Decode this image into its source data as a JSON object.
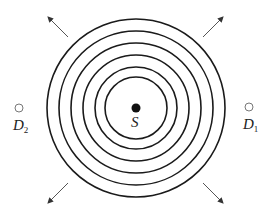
{
  "figure": {
    "colors": {
      "background": "#ffffff",
      "ink": "#1a1a1a",
      "detector": "#777777",
      "arrow": "#555555"
    },
    "source": {
      "label": "S",
      "cx": 136,
      "cy": 108,
      "r": 4.5
    },
    "wavefronts": {
      "cx": 136,
      "cy": 108,
      "radii": [
        31,
        41,
        53,
        65,
        77,
        89
      ]
    },
    "detectors": [
      {
        "id": "D2",
        "label": "D",
        "subscript": "2",
        "cx": 19,
        "cy": 108,
        "r": 4
      },
      {
        "id": "D1",
        "label": "D",
        "subscript": "1",
        "cx": 249,
        "cy": 107,
        "r": 4
      }
    ],
    "arrows": [
      {
        "direction": "up-left",
        "x1": 68,
        "y1": 37,
        "x2": 48,
        "y2": 17
      },
      {
        "direction": "up-right",
        "x1": 203,
        "y1": 37,
        "x2": 223,
        "y2": 17
      },
      {
        "direction": "down-left",
        "x1": 68,
        "y1": 183,
        "x2": 48,
        "y2": 203
      },
      {
        "direction": "down-right",
        "x1": 203,
        "y1": 183,
        "x2": 223,
        "y2": 203
      }
    ]
  }
}
